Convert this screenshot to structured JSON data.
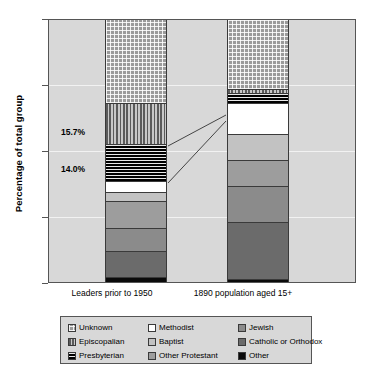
{
  "chart_data": {
    "type": "bar",
    "subtype": "stacked-100-percent",
    "title": "",
    "xlabel": "",
    "ylabel": "Percentage of total group",
    "ylim": [
      0,
      100
    ],
    "yticks": [
      0,
      25,
      50,
      75,
      100
    ],
    "ytick_labels": [
      "0",
      "25",
      "50",
      "75",
      "100"
    ],
    "grid": true,
    "legend_position": "bottom",
    "categories": [
      "Leaders prior to 1950",
      "1890 population aged 15+"
    ],
    "series": [
      {
        "name": "Other",
        "pattern": "solid-black",
        "color": "#0a0a0a",
        "values": [
          2.0,
          1.0
        ]
      },
      {
        "name": "Catholic or Orthodox",
        "pattern": "solid-dark-gray",
        "color": "#6b6b6b",
        "values": [
          10.0,
          22.0
        ]
      },
      {
        "name": "Jewish",
        "pattern": "solid-gray",
        "color": "#8b8b8b",
        "values": [
          8.5,
          13.5
        ]
      },
      {
        "name": "Other Protestant",
        "pattern": "solid-medium-gray",
        "color": "#9d9d9d",
        "values": [
          10.5,
          10.0
        ]
      },
      {
        "name": "Baptist",
        "pattern": "solid-light-gray",
        "color": "#c2c2c2",
        "values": [
          3.5,
          10.0
        ]
      },
      {
        "name": "Methodist",
        "pattern": "solid-white",
        "color": "#ffffff",
        "values": [
          4.0,
          12.0
        ]
      },
      {
        "name": "Presbyterian",
        "pattern": "horizontal-lines",
        "color": "#111111",
        "values": [
          14.0,
          3.5
        ]
      },
      {
        "name": "Episcopalian",
        "pattern": "vertical-lines",
        "color": "#8a8a8a",
        "values": [
          15.7,
          1.5
        ]
      },
      {
        "name": "Unknown",
        "pattern": "checkered-dots",
        "color": "#9a9a9a",
        "values": [
          31.8,
          26.5
        ]
      }
    ],
    "annotations": [
      {
        "text": "15.7%",
        "series": "Episcopalian",
        "category": "Leaders prior to 1950"
      },
      {
        "text": "14.0%",
        "series": "Presbyterian",
        "category": "Leaders prior to 1950"
      }
    ]
  },
  "axis": {
    "y_title": "Percentage of total group",
    "ticks": [
      "100",
      "75",
      "50",
      "25",
      "0"
    ]
  },
  "x_categories": [
    "Leaders prior to 1950",
    "1890 population aged 15+"
  ],
  "annotations": {
    "episcopalian_pct": "15.7%",
    "presbyterian_pct": "14.0%"
  },
  "legend": {
    "items": [
      {
        "label": "Unknown",
        "swatch": "checkered-dots-swatch"
      },
      {
        "label": "Methodist",
        "swatch": "white-swatch"
      },
      {
        "label": "Jewish",
        "swatch": "gray-swatch"
      },
      {
        "label": "Episcopalian",
        "swatch": "vertical-lines-swatch"
      },
      {
        "label": "Baptist",
        "swatch": "light-gray-swatch"
      },
      {
        "label": "Catholic or Orthodox",
        "swatch": "dark-gray-swatch"
      },
      {
        "label": "Presbyterian",
        "swatch": "horizontal-lines-swatch"
      },
      {
        "label": "Other Protestant",
        "swatch": "medium-gray-swatch"
      },
      {
        "label": "Other",
        "swatch": "black-swatch"
      }
    ]
  },
  "colors": {
    "plot_background": "#d8d8d8",
    "gridline": "#f2f2f2",
    "axis": "#555555",
    "text": "#000000"
  }
}
